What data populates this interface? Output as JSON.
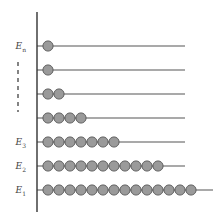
{
  "diagram": {
    "type": "energy-level occupancy diagram",
    "colors": {
      "axis": "#333333",
      "level_line": "#555555",
      "particle_fill": "#9a9a9a",
      "particle_stroke": "#555555",
      "label": "#444444",
      "ellipsis": "#333333"
    },
    "axis": {
      "x": 37,
      "y_top": 12,
      "y_bottom": 212
    },
    "levels": [
      {
        "label_base": "E",
        "label_sub": "n",
        "y": 46,
        "particles": 1,
        "line_end_x": 185
      },
      {
        "label_base": "",
        "label_sub": "",
        "y": 70,
        "particles": 1,
        "line_end_x": 185
      },
      {
        "label_base": "",
        "label_sub": "",
        "y": 94,
        "particles": 2,
        "line_end_x": 185
      },
      {
        "label_base": "",
        "label_sub": "",
        "y": 118,
        "particles": 4,
        "line_end_x": 185
      },
      {
        "label_base": "E",
        "label_sub": "3",
        "y": 142,
        "particles": 7,
        "line_end_x": 185
      },
      {
        "label_base": "E",
        "label_sub": "2",
        "y": 166,
        "particles": 11,
        "line_end_x": 185
      },
      {
        "label_base": "E",
        "label_sub": "1",
        "y": 190,
        "particles": 14,
        "line_end_x": 213
      }
    ],
    "particle": {
      "diameter": 11,
      "pitch": 11,
      "first_center_x": 48
    },
    "ellipsis": {
      "x": 18,
      "y_top": 62,
      "y_bottom": 112,
      "style": "dashed vertical"
    }
  }
}
